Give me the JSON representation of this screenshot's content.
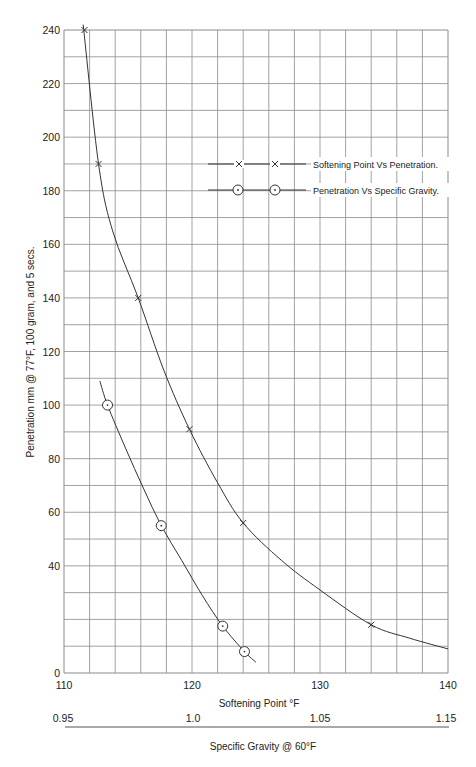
{
  "chart_data": {
    "type": "line",
    "title": "",
    "xlabel": "Softening Point °F",
    "x2label": "Specific Gravity @ 60°F",
    "ylabel": "Penetration mm @ 77°F, 100 gram, and 5 secs.",
    "xlim": [
      110,
      140
    ],
    "ylim": [
      0,
      240
    ],
    "x_ticks": [
      "110",
      "120",
      "130",
      "140"
    ],
    "x2_ticks": [
      "0.95",
      "1.0",
      "1.05",
      "1.15"
    ],
    "y_ticks": [
      "0",
      "40",
      "60",
      "80",
      "100",
      "120",
      "140",
      "160",
      "180",
      "200",
      "220",
      "240"
    ],
    "grid": true,
    "grid_x_step": 2,
    "grid_y_step": 10,
    "legend_position": "upper right",
    "series": [
      {
        "name": "Softening Point Vs Penetration.",
        "marker": "x",
        "x_axis": "softening_point",
        "points": [
          [
            111.6,
            240
          ],
          [
            112.7,
            190
          ],
          [
            115.8,
            140
          ],
          [
            119.8,
            91
          ],
          [
            124,
            56
          ],
          [
            134,
            18
          ]
        ],
        "curve": [
          [
            111.5,
            242
          ],
          [
            112.7,
            190
          ],
          [
            113.8,
            165
          ],
          [
            115.8,
            140
          ],
          [
            117.8,
            113
          ],
          [
            119.8,
            91
          ],
          [
            122,
            71
          ],
          [
            124,
            56
          ],
          [
            127,
            42
          ],
          [
            130,
            31
          ],
          [
            134,
            18
          ],
          [
            137,
            13
          ],
          [
            140,
            9
          ]
        ]
      },
      {
        "name": "Penetration Vs Specific Gravity.",
        "marker": "circle-dot",
        "x_axis": "softening_point_position",
        "points": [
          [
            113.4,
            100
          ],
          [
            117.6,
            55
          ],
          [
            122.4,
            17.5
          ],
          [
            124.1,
            8
          ]
        ],
        "curve": [
          [
            112.8,
            109
          ],
          [
            113.4,
            100
          ],
          [
            114.8,
            84
          ],
          [
            116.2,
            69
          ],
          [
            117.6,
            55
          ],
          [
            119.2,
            42
          ],
          [
            120.8,
            29
          ],
          [
            122.4,
            17.5
          ],
          [
            124.1,
            8
          ],
          [
            125,
            4
          ]
        ]
      }
    ]
  },
  "legend": {
    "items": [
      {
        "label": "Softening Point Vs Penetration."
      },
      {
        "label": "Penetration Vs Specific Gravity."
      }
    ]
  },
  "axes": {
    "x_title": "Softening Point °F",
    "x2_title": "Specific Gravity @ 60°F",
    "y_title": "Penetration mm @ 77°F, 100 gram, and 5 secs."
  },
  "colors": {
    "grid": "#8a8a8a",
    "line": "#333333",
    "text": "#222222"
  }
}
